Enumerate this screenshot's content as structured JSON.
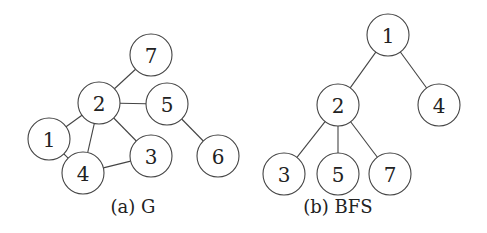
{
  "figure": {
    "node_radius": 21,
    "stroke_color": "#444444",
    "background": "#ffffff",
    "panels": [
      {
        "id": "a",
        "caption": "(a) G",
        "caption_pos": [
          133,
          213
        ],
        "nodes": [
          {
            "label": "7",
            "x": 151,
            "y": 55
          },
          {
            "label": "2",
            "x": 99,
            "y": 103
          },
          {
            "label": "5",
            "x": 167,
            "y": 104
          },
          {
            "label": "1",
            "x": 49,
            "y": 139
          },
          {
            "label": "4",
            "x": 83,
            "y": 173
          },
          {
            "label": "3",
            "x": 151,
            "y": 156
          },
          {
            "label": "6",
            "x": 218,
            "y": 156
          }
        ],
        "edges": [
          [
            "7",
            "2"
          ],
          [
            "2",
            "5"
          ],
          [
            "5",
            "6"
          ],
          [
            "2",
            "1"
          ],
          [
            "2",
            "4"
          ],
          [
            "2",
            "3"
          ],
          [
            "1",
            "4"
          ],
          [
            "4",
            "3"
          ]
        ]
      },
      {
        "id": "b",
        "caption": "(b) BFS",
        "caption_pos": [
          338,
          213
        ],
        "nodes": [
          {
            "label": "1",
            "x": 388,
            "y": 35
          },
          {
            "label": "2",
            "x": 338,
            "y": 105
          },
          {
            "label": "4",
            "x": 439,
            "y": 105
          },
          {
            "label": "3",
            "x": 284,
            "y": 174
          },
          {
            "label": "5",
            "x": 338,
            "y": 174
          },
          {
            "label": "7",
            "x": 390,
            "y": 174
          }
        ],
        "edges": [
          [
            "1",
            "2"
          ],
          [
            "1",
            "4"
          ],
          [
            "2",
            "3"
          ],
          [
            "2",
            "5"
          ],
          [
            "2",
            "7"
          ]
        ]
      }
    ]
  }
}
